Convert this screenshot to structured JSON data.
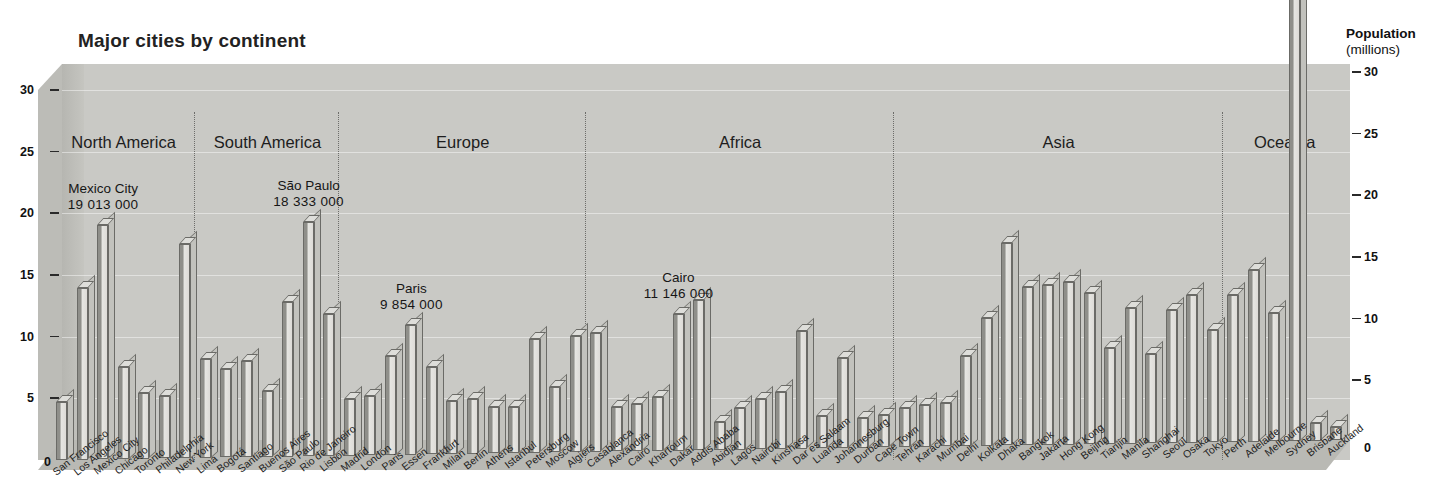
{
  "chart_data": {
    "type": "bar",
    "title": "Major cities by continent",
    "xlabel": "",
    "ylabel": "Population",
    "ylabel_unit": "(millions)",
    "ylim": [
      0,
      30
    ],
    "yticks": [
      "0",
      "5",
      "10",
      "15",
      "20",
      "25",
      "30"
    ],
    "grid": true,
    "legend_position": "none",
    "value_unit": "millions",
    "axis_caption": {
      "line1": "Population",
      "line2": "(millions)"
    },
    "groups": [
      {
        "name": "North America",
        "categories": [
          "San Francisco",
          "Los Angeles",
          "Mexico City",
          "Chicago",
          "Toronto",
          "Philadelphia",
          "New York"
        ],
        "values": [
          4.7,
          13.9,
          19.0,
          7.5,
          5.3,
          5.1,
          17.4
        ]
      },
      {
        "name": "South America",
        "categories": [
          "Lima",
          "Bogotá",
          "Santiago",
          "Buenos Aires",
          "São Paulo",
          "Rio de Janeiro",
          "Lisbon"
        ],
        "values": [
          8.0,
          7.2,
          7.8,
          5.3,
          12.5,
          19.0,
          11.5
        ]
      },
      {
        "name": "Europe",
        "categories": [
          "Madrid",
          "London",
          "Paris",
          "Essen",
          "Frankfurt",
          "Milan",
          "Berlin",
          "Athens",
          "Istanbul",
          "Petersburg",
          "Moscow",
          "Algiers"
        ],
        "values": [
          4.6,
          4.8,
          8.0,
          10.5,
          7.1,
          4.3,
          4.4,
          3.8,
          3.7,
          9.2,
          5.3,
          9.4
        ]
      },
      {
        "name": "Africa",
        "categories": [
          "Casablanca",
          "Alexandria",
          "Cairo",
          "Khartoum",
          "Dakar",
          "Addis Ababa",
          "Abidjan",
          "Lagos",
          "Nairobi",
          "Kinshasa",
          "Dar es Salaam",
          "Luanda",
          "Johannesburg",
          "Durban",
          "Cape Town"
        ],
        "values": [
          9.6,
          3.6,
          3.8,
          4.4,
          11.1,
          12.2,
          2.3,
          3.4,
          4.1,
          4.6,
          9.5,
          2.6,
          7.3,
          2.4,
          2.6
        ]
      },
      {
        "name": "Asia",
        "categories": [
          "Tehran",
          "Karachi",
          "Mumbai",
          "Delhi",
          "Kolkata",
          "Dhaka",
          "Bangkok",
          "Jakarta",
          "Hong Kong",
          "Beijing",
          "Tianjin",
          "Manila",
          "Shanghai",
          "Seoul",
          "Osaka",
          "Tokyo"
        ],
        "values": [
          3.2,
          3.4,
          3.5,
          7.3,
          10.4,
          16.4,
          12.8,
          13.0,
          13.2,
          12.3,
          7.8,
          11.0,
          7.2,
          10.8,
          12.0,
          9.1
        ]
      },
      {
        "name": "Oceania",
        "categories": [
          "Perth",
          "Adelaide",
          "Melbourne",
          "Sydney",
          "Brisbane",
          "Auckland"
        ],
        "values": [
          11.9,
          13.9,
          10.4,
          37.0,
          1.4,
          1.1
        ]
      }
    ],
    "bars": [
      {
        "label": "San Francisco",
        "value": 4.7
      },
      {
        "label": "Los Angeles",
        "value": 13.9
      },
      {
        "label": "Mexico City",
        "value": 19.0
      },
      {
        "label": "Chicago",
        "value": 7.5
      },
      {
        "label": "Toronto",
        "value": 5.3
      },
      {
        "label": "Philadelphia",
        "value": 5.1
      },
      {
        "label": "New York",
        "value": 17.4
      },
      {
        "label": "Lima",
        "value": 8.0
      },
      {
        "label": "Bogotá",
        "value": 7.2
      },
      {
        "label": "Santiago",
        "value": 7.8
      },
      {
        "label": "Buenos Aires",
        "value": 5.3
      },
      {
        "label": "São Paulo",
        "value": 12.5
      },
      {
        "label": "Rio de Janeiro",
        "value": 19.0
      },
      {
        "label": "Lisbon",
        "value": 11.5
      },
      {
        "label": "Madrid",
        "value": 4.6
      },
      {
        "label": "London",
        "value": 4.8
      },
      {
        "label": "Paris",
        "value": 8.0
      },
      {
        "label": "Essen",
        "value": 10.5
      },
      {
        "label": "Frankfurt",
        "value": 7.1
      },
      {
        "label": "Milan",
        "value": 4.3
      },
      {
        "label": "Berlin",
        "value": 4.4
      },
      {
        "label": "Athens",
        "value": 3.8
      },
      {
        "label": "Istanbul",
        "value": 3.7
      },
      {
        "label": "Petersburg",
        "value": 9.2
      },
      {
        "label": "Moscow",
        "value": 5.3
      },
      {
        "label": "Algiers",
        "value": 9.4
      },
      {
        "label": "Casablanca",
        "value": 9.6
      },
      {
        "label": "Alexandria",
        "value": 3.6
      },
      {
        "label": "Cairo",
        "value": 3.8
      },
      {
        "label": "Khartoum",
        "value": 4.4
      },
      {
        "label": "Dakar",
        "value": 11.1
      },
      {
        "label": "Addis Ababa",
        "value": 12.2
      },
      {
        "label": "Abidjan",
        "value": 2.3
      },
      {
        "label": "Lagos",
        "value": 3.4
      },
      {
        "label": "Nairobi",
        "value": 4.1
      },
      {
        "label": "Kinshasa",
        "value": 4.6
      },
      {
        "label": "Dar es Salaam",
        "value": 9.5
      },
      {
        "label": "Luanda",
        "value": 2.6
      },
      {
        "label": "Johannesburg",
        "value": 7.3
      },
      {
        "label": "Durban",
        "value": 2.4
      },
      {
        "label": "Cape Town",
        "value": 2.6
      },
      {
        "label": "Tehran",
        "value": 3.2
      },
      {
        "label": "Karachi",
        "value": 3.4
      },
      {
        "label": "Mumbai",
        "value": 3.5
      },
      {
        "label": "Delhi",
        "value": 7.3
      },
      {
        "label": "Kolkata",
        "value": 10.4
      },
      {
        "label": "Dhaka",
        "value": 16.4
      },
      {
        "label": "Bangkok",
        "value": 12.8
      },
      {
        "label": "Jakarta",
        "value": 13.0
      },
      {
        "label": "Hong Kong",
        "value": 13.2
      },
      {
        "label": "Beijing",
        "value": 12.3
      },
      {
        "label": "Tianjin",
        "value": 7.8
      },
      {
        "label": "Manila",
        "value": 11.0
      },
      {
        "label": "Shanghai",
        "value": 7.2
      },
      {
        "label": "Seoul",
        "value": 10.8
      },
      {
        "label": "Osaka",
        "value": 12.0
      },
      {
        "label": "Tokyo",
        "value": 9.1
      },
      {
        "label": "Perth",
        "value": 11.9
      },
      {
        "label": "Adelaide",
        "value": 13.9
      },
      {
        "label": "Melbourne",
        "value": 10.4
      },
      {
        "label": "Sydney",
        "value": 37.0
      },
      {
        "label": "Brisbane",
        "value": 1.4
      },
      {
        "label": "Auckland",
        "value": 1.1
      }
    ],
    "annotations": [
      {
        "name": "Mexico City",
        "value": "19 013 000",
        "bar_index": 2
      },
      {
        "name": "São Paulo",
        "value": "18 333 000",
        "bar_index": 12
      },
      {
        "name": "Paris",
        "value": "9 854 000",
        "bar_index": 17
      },
      {
        "name": "Cairo",
        "value": "11 146 000",
        "bar_index": 30
      },
      {
        "name": "Sydney",
        "value": "3 907 000",
        "bar_index": 60
      }
    ],
    "origin_marker": "0"
  }
}
